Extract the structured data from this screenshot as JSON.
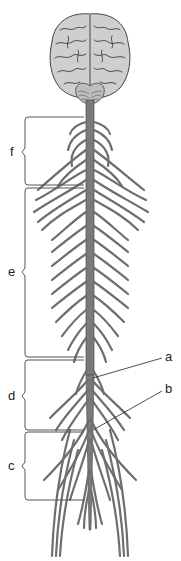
{
  "diagram": {
    "colors": {
      "nerve": "#6e6e6e",
      "nerve_outline": "#4a4a4a",
      "brain_fill": "#c9c9c9",
      "brain_sulci": "#3c3c3c",
      "bracket": "#555555",
      "background": "#ffffff"
    },
    "bracket_labels": [
      {
        "id": "f",
        "text": "f",
        "y_top": 117,
        "y_bottom": 185
      },
      {
        "id": "e",
        "text": "e",
        "y_top": 188,
        "y_bottom": 357
      },
      {
        "id": "d",
        "text": "d",
        "y_top": 360,
        "y_bottom": 430
      },
      {
        "id": "c",
        "text": "c",
        "y_top": 432,
        "y_bottom": 500
      }
    ],
    "pointer_labels": [
      {
        "id": "a",
        "text": "a",
        "x": 165,
        "y": 352
      },
      {
        "id": "b",
        "text": "b",
        "x": 165,
        "y": 383
      }
    ]
  }
}
